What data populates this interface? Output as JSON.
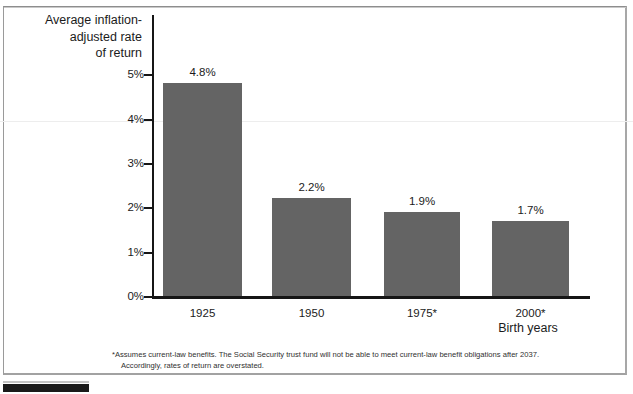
{
  "chart_data": {
    "type": "bar",
    "title": "",
    "categories": [
      "1925",
      "1950",
      "1975*",
      "2000*"
    ],
    "values": [
      4.8,
      2.2,
      1.9,
      1.7
    ],
    "value_labels": [
      "4.8%",
      "2.2%",
      "1.9%",
      "1.7%"
    ],
    "xlabel": "Birth years",
    "ylabel": "Average inflation-adjusted rate of return",
    "ylim": [
      0,
      5
    ],
    "ytick_labels": [
      "0%",
      "1%",
      "2%",
      "3%",
      "4%",
      "5%"
    ],
    "ytick_values": [
      0,
      1,
      2,
      3,
      4,
      5
    ],
    "grid": false,
    "legend": "none",
    "bar_color": "#646464",
    "axis_color": "#161616",
    "text_color": "#1b1b1b"
  },
  "axes": {
    "y_title_line1": "Average inflation-",
    "y_title_line2": "adjusted rate",
    "y_title_line3": "of return",
    "x_title": "Birth years"
  },
  "footnote": {
    "line1": "*Assumes current-law benefits.  The Social Security trust fund will not be able to meet current-law benefit obligations after 2037.",
    "line2": "Accordingly, rates of return are overstated."
  }
}
